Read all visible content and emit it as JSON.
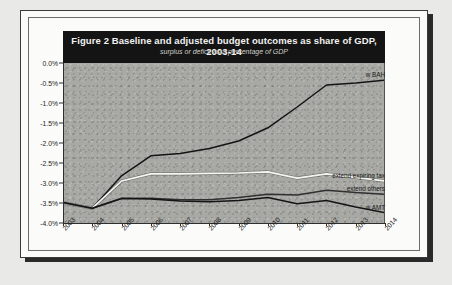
{
  "figure": {
    "title": "Figure 2 Baseline and adjusted budget outcomes as share of GDP, 2003-14",
    "subtitle": "surplus or deficit as a percentage of GDP"
  },
  "chart_data": {
    "type": "line",
    "title": "Figure 2 Baseline and adjusted budget outcomes as share of GDP, 2003-14",
    "subtitle": "surplus or deficit as a percentage of GDP",
    "xlabel": "",
    "ylabel": "",
    "ylim": [
      -4.0,
      0.0
    ],
    "ytick_labels": [
      "0.0%",
      "-0.5%",
      "-1.0%",
      "-1.5%",
      "-2.0%",
      "-2.5%",
      "-3.0%",
      "-3.5%",
      "-4.0%"
    ],
    "ytick_values": [
      0.0,
      -0.5,
      -1.0,
      -1.5,
      -2.0,
      -2.5,
      -3.0,
      -3.5,
      -4.0
    ],
    "grid": false,
    "legend_position": "right-inline",
    "categories": [
      "2003",
      "2004",
      "2005",
      "2006",
      "2007",
      "2008",
      "2009",
      "2010",
      "2011",
      "2012",
      "2013",
      "2014"
    ],
    "series": [
      {
        "name": "baseline",
        "label": "w BAH",
        "color": "#141414",
        "values": [
          -3.49,
          -3.63,
          -2.82,
          -2.32,
          -2.26,
          -2.14,
          -1.95,
          -1.62,
          -1.1,
          -0.55,
          -0.5,
          -0.43
        ]
      },
      {
        "name": "extend-expiring-tax",
        "label": "extend expiring tax",
        "color": "#f5f5f1",
        "values": [
          -3.49,
          -3.63,
          -2.95,
          -2.77,
          -2.77,
          -2.76,
          -2.75,
          -2.72,
          -2.88,
          -2.77,
          -2.86,
          -2.95
        ]
      },
      {
        "name": "extend-others",
        "label": "extend others",
        "color": "#303030",
        "values": [
          -3.49,
          -3.63,
          -3.38,
          -3.38,
          -3.42,
          -3.42,
          -3.36,
          -3.28,
          -3.3,
          -3.18,
          -3.24,
          -3.28
        ]
      },
      {
        "name": "with-amt",
        "label": "w AMT",
        "color": "#141414",
        "values": [
          -3.49,
          -3.63,
          -3.39,
          -3.4,
          -3.45,
          -3.47,
          -3.44,
          -3.36,
          -3.52,
          -3.44,
          -3.6,
          -3.74
        ]
      }
    ]
  }
}
